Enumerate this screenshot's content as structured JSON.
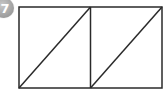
{
  "badge": {
    "number": "7",
    "color": "#a6a6a6",
    "text_color": "#ffffff"
  },
  "figure": {
    "stroke_color": "#2a2a2a",
    "stroke_width": 1.5,
    "outer_rect": {
      "x": 19,
      "y": 7,
      "width": 143,
      "height": 81
    },
    "divider": {
      "x1": 90.5,
      "y1": 7,
      "x2": 90.5,
      "y2": 88
    },
    "diagonals": [
      {
        "x1": 19,
        "y1": 88,
        "x2": 90.5,
        "y2": 7
      },
      {
        "x1": 90.5,
        "y1": 88,
        "x2": 162,
        "y2": 7
      }
    ]
  }
}
